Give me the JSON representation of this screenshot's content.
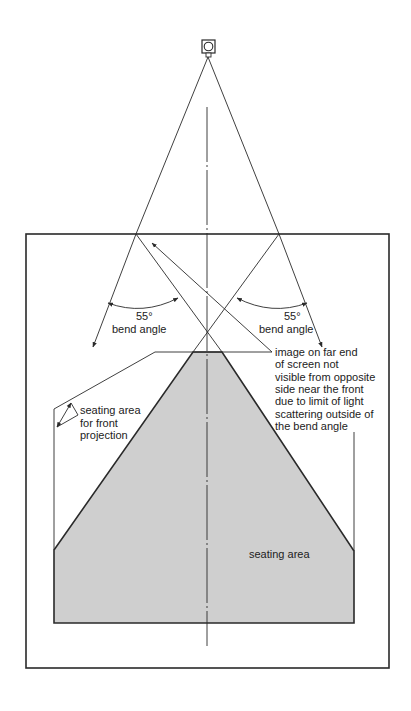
{
  "diagram": {
    "colors": {
      "line": "#2a2a2a",
      "seating_fill": "#cfcfcf",
      "background": "#ffffff"
    },
    "projector": {
      "icon": "projector-icon"
    },
    "bend_angle_left": {
      "value": "55°",
      "label": "bend angle"
    },
    "bend_angle_right": {
      "value": "55°",
      "label": "bend angle"
    },
    "annotation": {
      "lines": [
        "image on far end",
        "of screen not",
        "visible from opposite",
        "side near the front",
        "due to limit of light",
        "scattering outside of",
        "the bend angle"
      ]
    },
    "front_projection_label": {
      "lines": [
        "seating area",
        "for front",
        "projection"
      ]
    },
    "seating_area_label": "seating area"
  }
}
